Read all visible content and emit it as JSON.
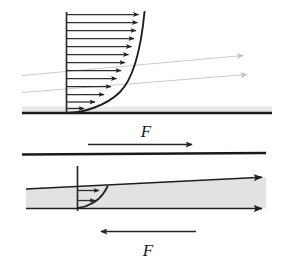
{
  "figure": {
    "background_color": "#ffffff",
    "width": 283,
    "height": 262
  },
  "colors": {
    "plate_dark": "#1a1a1a",
    "profile_curve": "#1f1f1f",
    "velocity_arrow": "#2a2a2a",
    "streamline_gray": "#c9c9c9",
    "fluid_fill": "#e2e2e2",
    "shadow_band": "#e6e6e6",
    "label_text": "#1a1a1a"
  },
  "top_panel": {
    "name": "upper-boundary-layer-panel",
    "plate": {
      "label": "stationary-wall",
      "x1": 22,
      "x2": 272,
      "y": 113,
      "thickness": 2.4
    },
    "shadow_band": {
      "x": 22,
      "y": 106,
      "width": 250,
      "height": 6
    },
    "profile": {
      "axis_x": 66,
      "axis_top_y": 12,
      "axis_bottom_y": 113,
      "curve_top_x": 144,
      "curve_bottom_x": 66,
      "arrow_count": 14,
      "description": "parabolic velocity profile, zero at wall growing to free stream"
    },
    "velocity_arrow_lengths_px": [
      78,
      77,
      75,
      73,
      70,
      67,
      63,
      58,
      53,
      47,
      40,
      32,
      22,
      10
    ],
    "streamlines": [
      {
        "name": "streamline-upper",
        "x1": 22,
        "y1": 75,
        "x2": 248,
        "y2": 55
      },
      {
        "name": "streamline-lower",
        "x1": 22,
        "y1": 92,
        "x2": 252,
        "y2": 74
      }
    ]
  },
  "middle_panel": {
    "name": "moving-plate-panel",
    "force_label": "F",
    "force_arrow": {
      "name": "force-arrow-right",
      "x1": 88,
      "y1": 144,
      "x2": 195,
      "y2": 144,
      "direction": "right"
    },
    "label_position": {
      "x": 146,
      "y": 136
    },
    "plate": {
      "label": "upper-moving-plate",
      "x1": 22,
      "x2": 266,
      "y": 154,
      "thickness": 2.4
    }
  },
  "bottom_panel": {
    "name": "lower-wedge-panel",
    "fluid_wedge": {
      "name": "fluid-film-wedge",
      "left_x": 26,
      "right_x": 266,
      "left_top_y": 189,
      "right_top_y": 177,
      "left_bottom_y": 208,
      "right_bottom_y": 208,
      "description": "tapered lubricating film, thicker at right"
    },
    "top_surface_arrow": {
      "name": "wedge-top-flow-arrow",
      "x1": 26,
      "y1": 189,
      "x2": 266,
      "y2": 177,
      "direction": "right"
    },
    "bottom_surface_arrow": {
      "name": "wedge-bottom-flow-arrow",
      "x1": 26,
      "y1": 208,
      "x2": 266,
      "y2": 208,
      "direction": "right"
    },
    "profile": {
      "axis_x": 77,
      "axis_top_y": 166,
      "axis_bottom_y": 211,
      "arrow_count": 2,
      "arrow_lengths_px": [
        26,
        22
      ],
      "arrow_y": [
        190,
        200
      ],
      "curve_top_x": 107,
      "description": "small parabolic velocity profile inside the film"
    },
    "force_label": "F",
    "force_arrow": {
      "name": "force-arrow-left",
      "x1": 196,
      "y1": 231,
      "x2": 98,
      "y2": 231,
      "direction": "left"
    },
    "label_position": {
      "x": 148,
      "y": 255
    }
  },
  "annotations": {
    "force_symbol": "F",
    "icon_names": [
      "arrow-right-icon",
      "arrow-left-icon",
      "streamline-arrow-icon"
    ]
  }
}
